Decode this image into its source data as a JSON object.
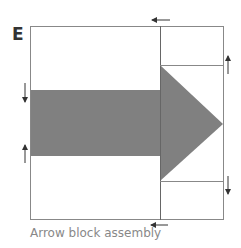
{
  "figure": {
    "panel_letter": "E",
    "caption": "Arrow block assembly",
    "colors": {
      "outline": "#808080",
      "fill": "#808080",
      "arrow_marks": "#333333",
      "caption": "#888888"
    },
    "elements": [
      {
        "type": "square-outline",
        "name": "outer-square"
      },
      {
        "type": "vertical-divider",
        "name": "section-divider"
      },
      {
        "type": "rectangle",
        "name": "arrow-shaft",
        "fill": "gray"
      },
      {
        "type": "triangle",
        "name": "arrow-head",
        "fill": "gray"
      },
      {
        "type": "horizontal-line",
        "name": "upper-right-line"
      },
      {
        "type": "horizontal-line",
        "name": "lower-right-line"
      },
      {
        "type": "arrow-mark",
        "direction": "left",
        "position": "top"
      },
      {
        "type": "arrow-mark",
        "direction": "left",
        "position": "bottom"
      },
      {
        "type": "arrow-mark",
        "direction": "down",
        "position": "left-upper"
      },
      {
        "type": "arrow-mark",
        "direction": "up",
        "position": "left-lower"
      },
      {
        "type": "arrow-mark",
        "direction": "up",
        "position": "right-upper"
      },
      {
        "type": "arrow-mark",
        "direction": "down",
        "position": "right-lower"
      }
    ]
  }
}
